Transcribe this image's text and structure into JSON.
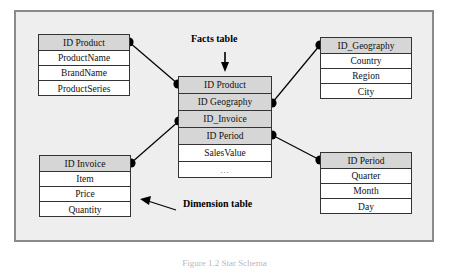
{
  "diagram": {
    "type": "star-schema",
    "title_caption": "Figure 1.2 Star Schema",
    "colors": {
      "panel_background": "#eeeeee",
      "panel_border": "#8a8a8a",
      "table_border": "#333333",
      "table_background": "#ffffff",
      "key_row_background": "#d6d6d6",
      "connector": "#000000",
      "text": "#111111"
    },
    "annotations": [
      {
        "id": "facts-table-note",
        "label": "Facts table",
        "arrow": "down"
      },
      {
        "id": "dimension-table-note",
        "label": "Dimension table",
        "arrow": "left"
      }
    ],
    "tables": [
      {
        "id": "product",
        "name": "ID_Product",
        "role": "dimension",
        "header": "ID  Product",
        "fields": [
          "ProductName",
          "BrandName",
          "ProductSeries"
        ]
      },
      {
        "id": "facts",
        "name": "Facts",
        "role": "fact",
        "keys": [
          "ID  Product",
          "ID  Geography",
          "ID_Invoice",
          "ID  Period"
        ],
        "measures": [
          "SalesValue",
          "..."
        ]
      },
      {
        "id": "geography",
        "name": "ID_Geography",
        "role": "dimension",
        "header": "ID_Geography",
        "fields": [
          "Country",
          "Region",
          "City"
        ]
      },
      {
        "id": "invoice",
        "name": "ID_Invoice",
        "role": "dimension",
        "header": "ID  Invoice",
        "fields": [
          "Item",
          "Price",
          "Quantity"
        ]
      },
      {
        "id": "period",
        "name": "ID_Period",
        "role": "dimension",
        "header": "ID  Period",
        "fields": [
          "Quarter",
          "Month",
          "Day"
        ]
      }
    ]
  }
}
